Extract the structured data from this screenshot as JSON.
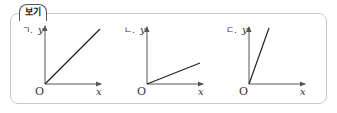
{
  "header": {
    "tab_label": "보기"
  },
  "graphs": [
    {
      "label": "ㄱ.",
      "y_axis_label": "y",
      "x_axis_label": "x",
      "origin_label": "O",
      "description": "line through origin, moderate slope (~1)"
    },
    {
      "label": "ㄴ.",
      "y_axis_label": "y",
      "x_axis_label": "x",
      "origin_label": "O",
      "description": "line through origin, shallow slope (~0.4)"
    },
    {
      "label": "ㄷ.",
      "y_axis_label": "y",
      "x_axis_label": "x",
      "origin_label": "O",
      "description": "line through origin, steep slope (~2.8)"
    }
  ],
  "colors": {
    "axis": "#555555",
    "line": "#222222",
    "border": "#c8c8c8"
  }
}
